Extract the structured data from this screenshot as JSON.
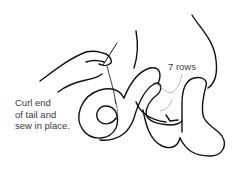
{
  "figure": {
    "type": "sewing illustration",
    "caption": {
      "lines": [
        "Curl end",
        "of tail and",
        "sew in place."
      ]
    },
    "annotation": {
      "text": "7 rows"
    },
    "colors": {
      "line": "#111111",
      "text": "#3a3a3a",
      "background": "#ffffff"
    }
  }
}
